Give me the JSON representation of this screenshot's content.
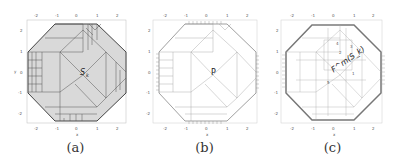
{
  "panels": [
    {
      "id": "a",
      "caption": "(a)",
      "region_label": "S",
      "region_sub": "k",
      "fill": "#d9d9d9",
      "stroke": "#444444"
    },
    {
      "id": "b",
      "caption": "(b)",
      "region_label": "P",
      "region_sub": "",
      "fill": "#ffffff",
      "stroke": "#888888"
    },
    {
      "id": "c",
      "caption": "(c)",
      "region_label": "F",
      "region_sub": "k",
      "region_sup": "m",
      "fill": "#ffffff",
      "stroke": "#999999"
    }
  ],
  "axes": {
    "ticks": [
      "-2",
      "-1",
      "0",
      "1",
      "2"
    ],
    "xlabel": "x",
    "ylabel": "y"
  },
  "panel_c_labels": {
    "main": "F^m(S_k)",
    "numbers": [
      "4",
      "3",
      "2",
      "1",
      "1",
      "5"
    ]
  }
}
